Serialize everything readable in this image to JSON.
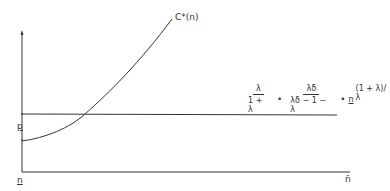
{
  "diagram": {
    "curve_label": "C*(n)",
    "y_axis_label_p": "p",
    "origin_label": "n",
    "x_axis_end_label": "n̄",
    "formula": {
      "frac1_num": "λ",
      "frac1_den": "1 + λ",
      "dot1": "•",
      "frac2_num": "λδ",
      "frac2_den": "λδ − 1 − λ",
      "dot2": "•",
      "base": "n",
      "exponent": "(1 + λ)/λ"
    }
  }
}
